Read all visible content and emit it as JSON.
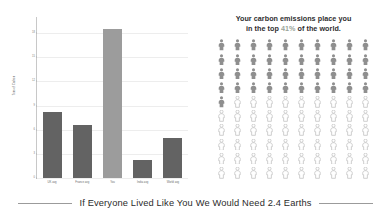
{
  "chart_data": {
    "type": "bar",
    "title": "",
    "xlabel": "",
    "ylabel": "Tons of Carbon",
    "categories": [
      "UK avg",
      "France avg",
      "You",
      "India avg",
      "World avg"
    ],
    "values": [
      8.2,
      6.6,
      18.5,
      2.2,
      5.0
    ],
    "ylim": [
      0,
      20
    ],
    "yticks": [
      0,
      3,
      6,
      9,
      12,
      15,
      18
    ],
    "ytick_labels": [
      "0",
      "3",
      "6",
      "9",
      "12",
      "15",
      "18"
    ],
    "grid": true,
    "legend": "none",
    "highlight_index": 2,
    "bar_color": "#636363",
    "highlight_color": "#9c9c9c"
  },
  "pictogram": {
    "headline_line1": "Your carbon emissions place you",
    "headline_line2_before": "in the top ",
    "percent": "41%",
    "headline_line2_after": " of the world.",
    "total_icons": 100,
    "filled_icons": 41,
    "columns": 10,
    "filled_color": "#8f8f8f",
    "empty_color": "#c3c3c3",
    "percent_color": "#9aa59a"
  },
  "caption": {
    "text": "If Everyone Lived Like You We Would Need 2.4 Earths",
    "earths": "2.4"
  }
}
